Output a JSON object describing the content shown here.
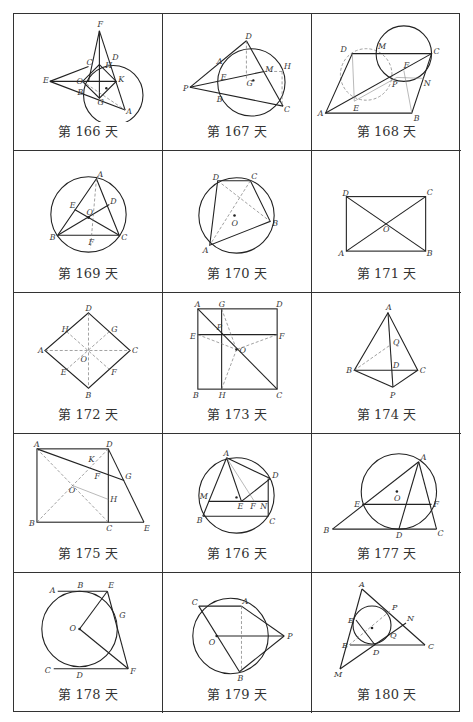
{
  "page": {
    "grid": {
      "rows": 5,
      "columns": 3
    }
  },
  "cells": [
    {
      "caption": "第 166 天",
      "labels": [
        "F",
        "C",
        "D",
        "H",
        "E",
        "B",
        "K",
        "G",
        "O",
        "A"
      ]
    },
    {
      "caption": "第 167 天",
      "labels": [
        "D",
        "A",
        "E",
        "G",
        "M",
        "H",
        "P",
        "B",
        "C"
      ]
    },
    {
      "caption": "第 168 天",
      "labels": [
        "D",
        "M",
        "C",
        "F",
        "P",
        "N",
        "E",
        "A",
        "B"
      ]
    },
    {
      "caption": "第 169 天",
      "labels": [
        "A",
        "D",
        "E",
        "O",
        "B",
        "F",
        "C"
      ]
    },
    {
      "caption": "第 170 天",
      "labels": [
        "D",
        "C",
        "O",
        "B",
        "A"
      ]
    },
    {
      "caption": "第 171 天",
      "labels": [
        "D",
        "C",
        "O",
        "A",
        "B"
      ]
    },
    {
      "caption": "第 172 天",
      "labels": [
        "D",
        "H",
        "G",
        "A",
        "C",
        "O",
        "E",
        "F",
        "B"
      ]
    },
    {
      "caption": "第 173 天",
      "labels": [
        "A",
        "G",
        "D",
        "P",
        "E",
        "F",
        "O",
        "B",
        "H",
        "C"
      ]
    },
    {
      "caption": "第 174 天",
      "labels": [
        "A",
        "Q",
        "B",
        "D",
        "C",
        "P"
      ]
    },
    {
      "caption": "第 175 天",
      "labels": [
        "A",
        "D",
        "K",
        "F",
        "G",
        "O",
        "H",
        "B",
        "C",
        "E"
      ]
    },
    {
      "caption": "第 176 天",
      "labels": [
        "A",
        "D",
        "M",
        "E",
        "F",
        "N",
        "B",
        "C"
      ]
    },
    {
      "caption": "第 177 天",
      "labels": [
        "A",
        "O",
        "E",
        "F",
        "B",
        "D",
        "C"
      ]
    },
    {
      "caption": "第 178 天",
      "labels": [
        "A",
        "B",
        "E",
        "G",
        "O",
        "C",
        "D",
        "F"
      ]
    },
    {
      "caption": "第 179 天",
      "labels": [
        "C",
        "A",
        "O",
        "P",
        "B"
      ]
    },
    {
      "caption": "第 180 天",
      "labels": [
        "A",
        "P",
        "E",
        "N",
        "Q",
        "B",
        "D",
        "C",
        "M"
      ]
    }
  ]
}
